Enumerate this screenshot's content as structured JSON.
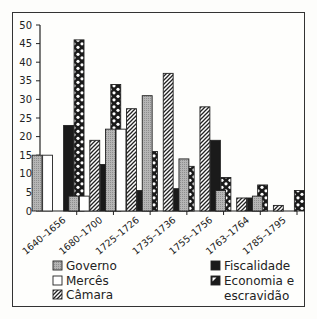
{
  "chart_data": {
    "type": "bar",
    "title": "",
    "xlabel": "",
    "ylabel": "",
    "ylim": [
      0,
      50
    ],
    "yticks": [
      0,
      5,
      10,
      15,
      20,
      25,
      30,
      35,
      40,
      45,
      50
    ],
    "grid": false,
    "legend_position": "bottom",
    "categories": [
      "1640–1656",
      "1680–1700",
      "1725–1726",
      "1735–1736",
      "1755–1756",
      "1763–1764",
      "1785–1795"
    ],
    "series": [
      {
        "name": "Governo",
        "pattern": "gray",
        "values": [
          15,
          4,
          22,
          31,
          14,
          5.5,
          4
        ]
      },
      {
        "name": "Mercês",
        "pattern": "white",
        "values": [
          15,
          4,
          22,
          0,
          0,
          0,
          0
        ]
      },
      {
        "name": "Câmara",
        "pattern": "diagonal",
        "values": [
          0,
          19,
          27.5,
          37,
          28,
          3.5,
          1.5
        ]
      },
      {
        "name": "Fiscalidade",
        "pattern": "black",
        "values": [
          23,
          12.5,
          5.5,
          6,
          19,
          3.5,
          0
        ]
      },
      {
        "name": "Economia e escravidão",
        "pattern": "dots",
        "values": [
          46,
          34,
          16,
          12,
          9,
          7,
          5.5
        ]
      }
    ]
  },
  "legend": {
    "left": [
      "Governo",
      "Mercês",
      "Câmara"
    ],
    "right_line1": "Fiscalidade",
    "right_line2a": "Economia e",
    "right_line2b": "escravidão"
  }
}
